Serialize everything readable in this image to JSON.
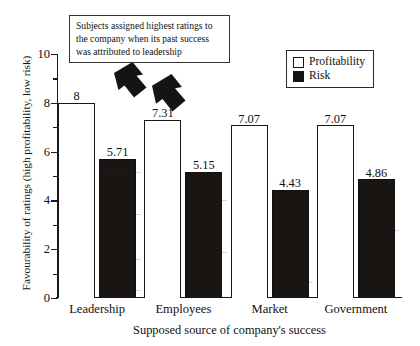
{
  "chart_data": {
    "type": "bar",
    "title": "",
    "xlabel": "Supposed source of company's success",
    "ylabel": "Favourability of ratings (high profitability, low risk)",
    "ylim": [
      0,
      10
    ],
    "ytick_labels": [
      "0",
      "2",
      "4",
      "6",
      "8",
      "10"
    ],
    "ytick_values": [
      0,
      2,
      4,
      6,
      8,
      10
    ],
    "yminor_values": [
      1,
      3,
      5,
      7,
      9
    ],
    "grid": false,
    "legend_position": "top-right",
    "categories": [
      "Leadership",
      "Employees",
      "Market",
      "Government"
    ],
    "series": [
      {
        "name": "Profitability",
        "color": "#ffffff",
        "values": [
          8,
          7.31,
          7.07,
          7.07
        ],
        "labels": [
          "8",
          "7.31",
          "7.07",
          "7.07"
        ]
      },
      {
        "name": "Risk",
        "color": "#141414",
        "values": [
          5.71,
          5.15,
          4.43,
          4.86
        ],
        "labels": [
          "5.71",
          "5.15",
          "4.43",
          "4.86"
        ]
      }
    ],
    "annotations": [
      {
        "name": "callout-text",
        "text": "Subjects assigned highest ratings to the company when its past success was attributed to leadership",
        "lines": [
          "Subjects assigned highest ratings to",
          "the company when its past success",
          "was attributed to leadership"
        ],
        "pointers": 2,
        "pointer_direction": "down-left"
      }
    ]
  },
  "legend": {
    "items": [
      {
        "label": "Profitability",
        "swatch": "open-square-swatch"
      },
      {
        "label": "Risk",
        "swatch": "filled-square-swatch"
      }
    ]
  },
  "axes": {
    "y_title": "Favourability of ratings (high profitability, low risk)",
    "x_title": "Supposed source of company's success"
  }
}
